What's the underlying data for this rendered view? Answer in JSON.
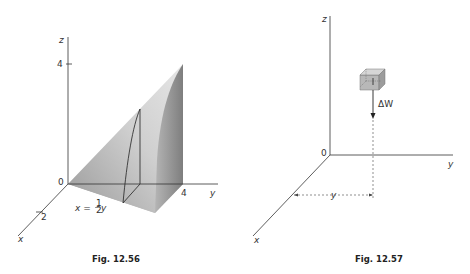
{
  "figures": [
    {
      "caption": "Fig. 12.56",
      "axes": {
        "x": "x",
        "y": "y",
        "z": "z",
        "origin": "0"
      },
      "ticks": {
        "z": "4",
        "y": "4",
        "x": "2"
      },
      "annotation": {
        "lhs": "x =",
        "frac_num": "1",
        "frac_den": "2",
        "rhs": "y"
      }
    },
    {
      "caption": "Fig. 12.57",
      "axes": {
        "x": "x",
        "y": "y",
        "z": "z",
        "origin": "0"
      },
      "force_label": "ΔW",
      "distance_label": "y"
    }
  ],
  "colors": {
    "axis": "#333333",
    "solid_light": "#d8d8d8",
    "solid_dark": "#8a8a8a",
    "cube": "#b8b8b8"
  }
}
